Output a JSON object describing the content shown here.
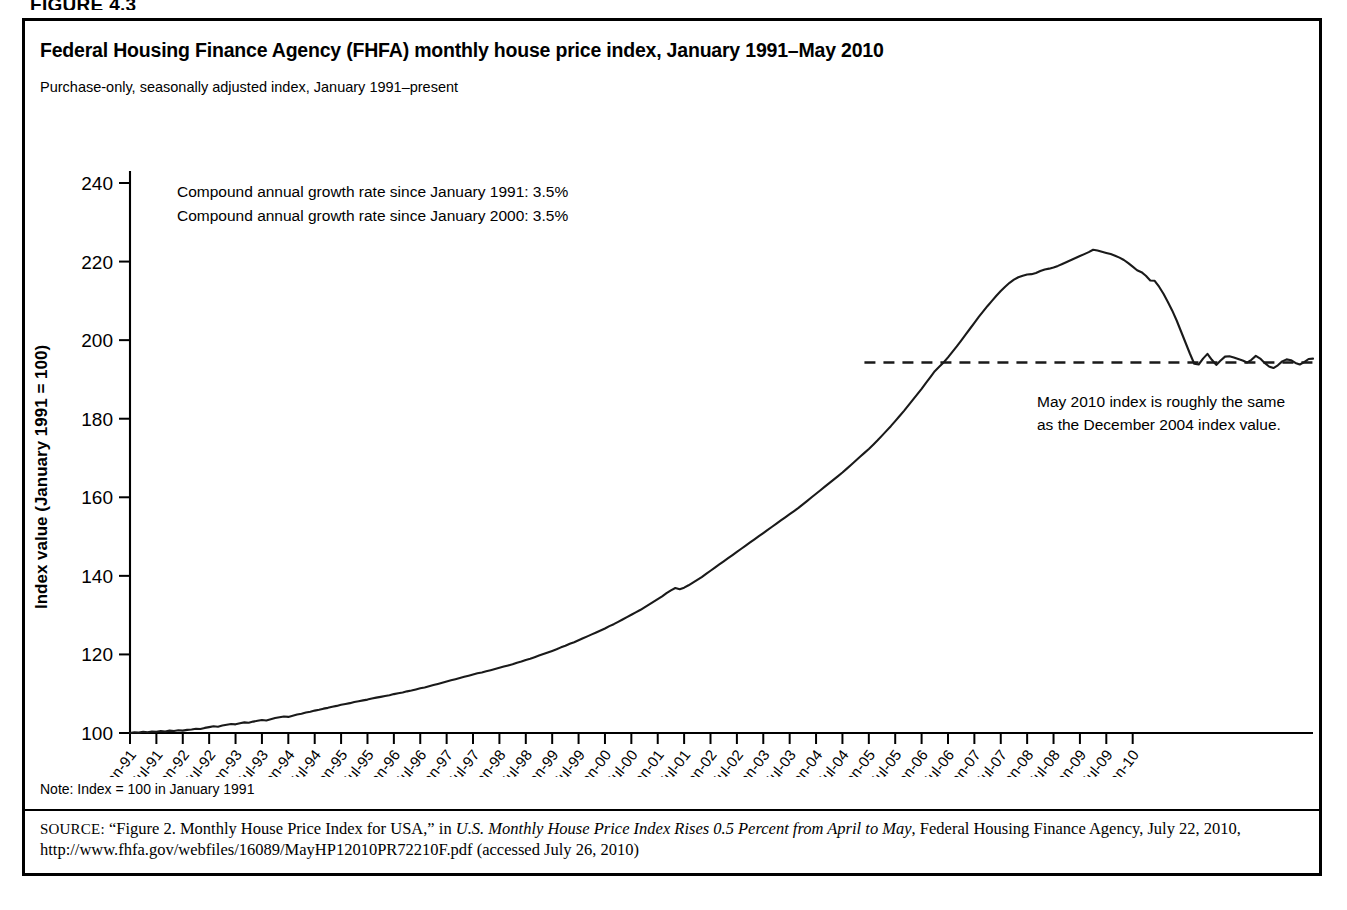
{
  "figure_label": "FIGURE 4.3",
  "title": "Federal Housing Finance Agency (FHFA) monthly house price index, January 1991–May 2010",
  "subtitle": "Purchase-only, seasonally adjusted index, January 1991–present",
  "note": "Note: Index = 100 in January 1991",
  "source": {
    "prefix": "SOURCE:",
    "quoted": "“Figure 2. Monthly House Price Index for USA,” in ",
    "italic_title": "U.S. Monthly House Price Index Rises 0.5 Percent from April to May",
    "tail": ", Federal Housing Finance Agency, July 22, 2010, http://www.fhfa.gov/webfiles/16089/MayHP12010PR72210F.pdf (accessed July 26, 2010)"
  },
  "annotations": {
    "cagr_1991": "Compound annual growth rate since January 1991: 3.5%",
    "cagr_2000": "Compound annual growth rate since January 2000: 3.5%",
    "dashed_note_line1": "May 2010 index is roughly the same",
    "dashed_note_line2": "as the December 2004 index value."
  },
  "chart_data": {
    "type": "line",
    "title": "Federal Housing Finance Agency (FHFA) monthly house price index, January 1991–May 2010",
    "xlabel": "",
    "ylabel": "Index value (January 1991 = 100)",
    "ylim": [
      100,
      240
    ],
    "yticks": [
      100,
      120,
      140,
      160,
      180,
      200,
      220,
      240
    ],
    "grid": false,
    "legend": "none",
    "line_color": "#1a1a1a",
    "x_start": "Jan-91",
    "x_end": "May-10",
    "xticks": [
      "Jan-91",
      "Jul-91",
      "Jan-92",
      "Jul-92",
      "Jan-93",
      "Jul-93",
      "Jan-94",
      "Jul-94",
      "Jan-95",
      "Jul-95",
      "Jan-96",
      "Jul-96",
      "Jan-97",
      "Jul-97",
      "Jan-98",
      "Jul-98",
      "Jan-99",
      "Jul-99",
      "Jan-00",
      "Jul-00",
      "Jan-01",
      "Jul-01",
      "Jan-02",
      "Jul-02",
      "Jan-03",
      "Jul-03",
      "Jan-04",
      "Jul-04",
      "Jan-05",
      "Jul-05",
      "Jan-06",
      "Jul-06",
      "Jan-07",
      "Jul-07",
      "Jan-08",
      "Jul-08",
      "Jan-09",
      "Jul-09",
      "Jan-10"
    ],
    "reference_line": {
      "value": 194.3,
      "style": "dashed",
      "from": "Dec-04",
      "to": "May-10",
      "label": "May 2010 index is roughly the same as the December 2004 index value."
    },
    "peak": {
      "x": "Apr-07",
      "y": 223.0
    },
    "series": [
      {
        "name": "FHFA purchase-only seasonally adjusted HPI",
        "x_monthly_start": "1991-01",
        "values": [
          100.0,
          100.2,
          100.1,
          100.3,
          100.2,
          100.4,
          100.3,
          100.5,
          100.4,
          100.6,
          100.5,
          100.7,
          100.6,
          100.8,
          100.9,
          101.1,
          101.0,
          101.3,
          101.5,
          101.7,
          101.6,
          101.9,
          102.1,
          102.3,
          102.2,
          102.5,
          102.7,
          102.6,
          102.9,
          103.1,
          103.3,
          103.2,
          103.5,
          103.8,
          104.0,
          104.2,
          104.1,
          104.4,
          104.7,
          104.9,
          105.2,
          105.4,
          105.7,
          105.9,
          106.2,
          106.4,
          106.7,
          106.9,
          107.2,
          107.4,
          107.6,
          107.9,
          108.1,
          108.3,
          108.5,
          108.8,
          109.0,
          109.2,
          109.4,
          109.6,
          109.9,
          110.1,
          110.3,
          110.6,
          110.8,
          111.1,
          111.4,
          111.6,
          111.9,
          112.2,
          112.5,
          112.8,
          113.1,
          113.4,
          113.7,
          114.0,
          114.3,
          114.6,
          114.9,
          115.2,
          115.4,
          115.7,
          116.0,
          116.3,
          116.6,
          116.9,
          117.2,
          117.5,
          117.9,
          118.2,
          118.6,
          118.9,
          119.3,
          119.7,
          120.1,
          120.5,
          120.9,
          121.3,
          121.8,
          122.2,
          122.7,
          123.1,
          123.6,
          124.1,
          124.6,
          125.1,
          125.6,
          126.1,
          126.6,
          127.2,
          127.7,
          128.3,
          128.9,
          129.5,
          130.1,
          130.7,
          131.3,
          132.0,
          132.7,
          133.4,
          134.1,
          134.8,
          135.6,
          136.3,
          136.9,
          136.6,
          137.0,
          137.6,
          138.3,
          139.0,
          139.7,
          140.5,
          141.3,
          142.1,
          142.9,
          143.7,
          144.5,
          145.3,
          146.1,
          146.9,
          147.7,
          148.5,
          149.3,
          150.1,
          150.9,
          151.7,
          152.5,
          153.3,
          154.1,
          154.9,
          155.7,
          156.5,
          157.3,
          158.2,
          159.1,
          160.0,
          160.9,
          161.8,
          162.7,
          163.6,
          164.5,
          165.4,
          166.3,
          167.3,
          168.3,
          169.3,
          170.3,
          171.3,
          172.3,
          173.4,
          174.5,
          175.7,
          176.9,
          178.1,
          179.4,
          180.7,
          182.0,
          183.4,
          184.8,
          186.2,
          187.6,
          189.1,
          190.6,
          192.1,
          193.2,
          194.3,
          195.6,
          197.0,
          198.4,
          199.9,
          201.4,
          202.9,
          204.4,
          205.9,
          207.3,
          208.7,
          210.0,
          211.3,
          212.5,
          213.6,
          214.6,
          215.4,
          216.0,
          216.4,
          216.7,
          216.8,
          217.1,
          217.6,
          218.0,
          218.2,
          218.5,
          218.9,
          219.4,
          219.9,
          220.4,
          220.9,
          221.4,
          221.9,
          222.4,
          223.0,
          222.8,
          222.5,
          222.2,
          221.9,
          221.5,
          221.0,
          220.4,
          219.6,
          218.7,
          217.8,
          217.3,
          216.4,
          215.2,
          215.1,
          213.6,
          211.8,
          209.7,
          207.5,
          205.0,
          202.2,
          199.4,
          196.6,
          194.0,
          193.8,
          195.3,
          196.5,
          195.0,
          193.7,
          194.8,
          195.8,
          195.9,
          195.6,
          195.2,
          194.8,
          194.3,
          195.0,
          196.0,
          195.3,
          194.2,
          193.3,
          192.9,
          193.6,
          194.6,
          195.1,
          194.9,
          194.2,
          193.8,
          194.4,
          195.2,
          195.3
        ]
      }
    ]
  }
}
